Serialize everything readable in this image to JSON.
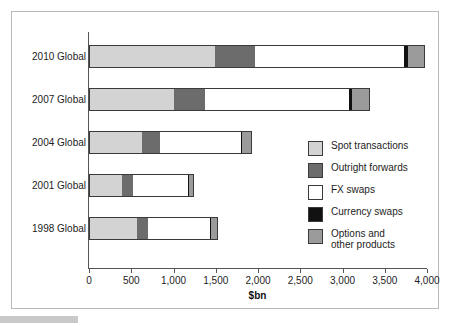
{
  "chart_data": {
    "type": "bar",
    "orientation": "horizontal",
    "stacked": true,
    "title": "",
    "xlabel": "$bn",
    "ylabel": "",
    "xlim": [
      0,
      4000
    ],
    "xticks": [
      0,
      500,
      1000,
      1500,
      2000,
      2500,
      3000,
      3500,
      4000
    ],
    "xtick_labels": [
      "0",
      "500",
      "1,000",
      "1,500",
      "2,000",
      "2,500",
      "3,000",
      "3,500",
      "4,000"
    ],
    "grid": false,
    "legend_position": "center-right",
    "categories": [
      "2010 Global",
      "2007 Global",
      "2004 Global",
      "2001 Global",
      "1998 Global"
    ],
    "series": [
      {
        "name": "Spot transactions",
        "color": "#d3d3d3",
        "values": [
          1490,
          1005,
          631,
          386,
          568
        ]
      },
      {
        "name": "Outright forwards",
        "color": "#6c6c6c",
        "values": [
          475,
          362,
          209,
          130,
          128
        ]
      },
      {
        "name": "FX swaps",
        "color": "#ffffff",
        "values": [
          1765,
          1714,
          954,
          656,
          734
        ]
      },
      {
        "name": "Currency swaps",
        "color": "#111111",
        "values": [
          43,
          31,
          21,
          7,
          10
        ]
      },
      {
        "name": "Options and\nother products",
        "color": "#9b9b9b",
        "values": [
          207,
          212,
          119,
          60,
          87
        ]
      }
    ],
    "totals": [
      3981,
      3324,
      1934,
      1239,
      1527
    ]
  },
  "figure": {
    "x_axis_title": "$bn",
    "axis_color": "#555555",
    "border_color": "#b9b9b9",
    "shadow_color": "#cfcfcf"
  },
  "legend": {
    "items": [
      {
        "label": "Spot transactions",
        "color": "#d3d3d3"
      },
      {
        "label": "Outright forwards",
        "color": "#6c6c6c"
      },
      {
        "label": "FX swaps",
        "color": "#ffffff"
      },
      {
        "label": "Currency swaps",
        "color": "#111111"
      },
      {
        "label": "Options and\nother products",
        "color": "#9b9b9b"
      }
    ]
  }
}
